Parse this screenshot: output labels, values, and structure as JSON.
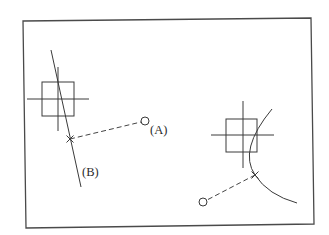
{
  "diagram": {
    "labels": {
      "a": "(A)",
      "b": "(B)"
    },
    "colors": {
      "stroke": "#3a3a3a",
      "frame": "#4a4a4a",
      "background": "#ffffff"
    },
    "left_group": {
      "description": "Square with crosshair, slanted straight line with X snap marker, dashed leader to circle (A); line labeled (B)",
      "square": {
        "x": 42,
        "y": 82,
        "w": 32,
        "h": 34
      },
      "crosshair_h": {
        "x1": 27,
        "y1": 99,
        "x2": 89,
        "y2": 99
      },
      "crosshair_v": {
        "x1": 58,
        "y1": 67,
        "x2": 58,
        "y2": 131
      },
      "slanted_line": {
        "x1": 51,
        "y1": 50,
        "x2": 81,
        "y2": 187
      },
      "x_marker": {
        "x": 70,
        "y": 139
      },
      "circle": {
        "cx": 145,
        "cy": 121,
        "r": 4
      }
    },
    "right_group": {
      "description": "Square with crosshair, arc with X snap marker, dashed leader to circle",
      "square": {
        "x": 226,
        "y": 119,
        "w": 31,
        "h": 33
      },
      "crosshair_h": {
        "x1": 211,
        "y1": 135,
        "x2": 274,
        "y2": 135
      },
      "crosshair_v": {
        "x1": 243,
        "y1": 101,
        "x2": 243,
        "y2": 168
      },
      "arc": {
        "start": [
          272,
          109
        ],
        "end": [
          297,
          203
        ]
      },
      "x_marker": {
        "x": 255,
        "y": 175
      },
      "circle": {
        "cx": 203,
        "cy": 202,
        "r": 4
      }
    }
  }
}
